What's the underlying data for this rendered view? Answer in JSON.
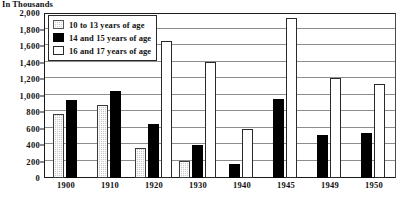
{
  "units_caption": "In Thousands",
  "top_faint_title": "",
  "legend": {
    "entries": [
      {
        "label": "10 to 13 years of age",
        "swatch": "dotted-gray-square",
        "color": "#c9c9c9"
      },
      {
        "label": "14 and 15 years of age",
        "swatch": "filled-black-square",
        "color": "#000000"
      },
      {
        "label": "16 and 17 years of age",
        "swatch": "open-white-square",
        "color": "#ffffff"
      }
    ]
  },
  "chart_data": {
    "type": "bar",
    "title": "",
    "subtitle": "In Thousands",
    "xlabel": "",
    "ylabel": "In Thousands",
    "ylim": [
      0,
      2000
    ],
    "ytick_step": 200,
    "ytick_labels": [
      "0",
      "200",
      "400",
      "600",
      "800",
      "1,000",
      "1,200",
      "1,400",
      "1,600",
      "1,800",
      "2,000"
    ],
    "ytick_values": [
      0,
      200,
      400,
      600,
      800,
      1000,
      1200,
      1400,
      1600,
      1800,
      2000
    ],
    "grid": true,
    "legend_position": "top-left-inside",
    "categories": [
      "1900",
      "1910",
      "1920",
      "1930",
      "1940",
      "1945",
      "1949",
      "1950"
    ],
    "series": [
      {
        "name": "10 to 13 years of age",
        "values": [
          780,
          880,
          360,
          210,
          0,
          0,
          0,
          0
        ]
      },
      {
        "name": "14 and 15 years of age",
        "values": [
          940,
          1060,
          660,
          400,
          170,
          960,
          520,
          540
        ]
      },
      {
        "name": "16 and 17 years of age",
        "values": [
          0,
          0,
          1660,
          1410,
          600,
          1940,
          1210,
          1140
        ]
      }
    ]
  }
}
